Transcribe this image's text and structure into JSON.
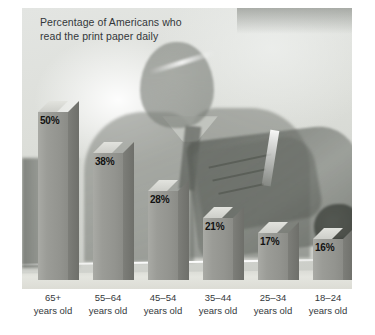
{
  "chart_data": {
    "type": "bar",
    "title": "Percentage of Americans who\nread the print paper daily",
    "xlabel": "",
    "ylabel": "",
    "ylim": [
      0,
      55
    ],
    "grid": false,
    "legend": false,
    "categories": [
      "65+\nyears old",
      "55–64\nyears old",
      "45–54\nyears old",
      "35–44\nyears old",
      "25–34\nyears old",
      "18–24\nyears old"
    ],
    "values": [
      50,
      38,
      28,
      21,
      17,
      16
    ],
    "value_labels": [
      "50%",
      "38%",
      "28%",
      "21%",
      "17%",
      "16%"
    ],
    "annotations": [],
    "background_image": "photo-man-reading-newspaper"
  },
  "bars": [
    {
      "label": "50%",
      "value": 50,
      "category": "65+\nyears old",
      "x": 16,
      "top": 93,
      "labelx": 14
    },
    {
      "label": "38%",
      "value": 38,
      "category": "55–64\nyears old",
      "x": 71,
      "top": 134,
      "labelx": 69
    },
    {
      "label": "28%",
      "value": 28,
      "category": "45–54\nyears old",
      "x": 126,
      "top": 172,
      "labelx": 124
    },
    {
      "label": "21%",
      "value": 21,
      "category": "35–44\nyears old",
      "x": 181,
      "top": 199,
      "labelx": 179
    },
    {
      "label": "17%",
      "value": 17,
      "category": "25–34\nyears old",
      "x": 236,
      "top": 214,
      "labelx": 234
    },
    {
      "label": "16%",
      "value": 16,
      "category": "18–24\nyears old",
      "x": 291,
      "top": 220,
      "labelx": 289
    }
  ],
  "colors": {
    "bar_face": "#9b9c97",
    "bar_top": "#dcdcd7",
    "bar_side": "#76776f",
    "title_text": "#33373a",
    "label_text": "#35393c",
    "value_text": "#121212",
    "plate_bg": "#d9dbd8",
    "page_bg": "#ffffff"
  }
}
